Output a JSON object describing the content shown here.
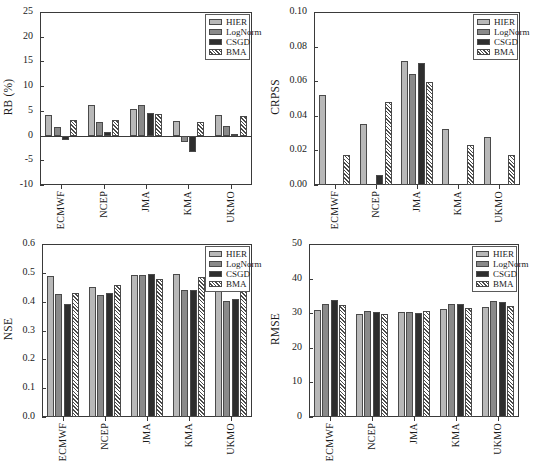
{
  "figure": {
    "panel_order": [
      "rb",
      "crpss",
      "nse",
      "rmse"
    ],
    "categories": [
      "ECMWF",
      "NCEP",
      "JMA",
      "KMA",
      "UKMO"
    ],
    "series_names": [
      "HIER",
      "LogNorm",
      "CSGD",
      "BMA"
    ],
    "colors": {
      "hier": "#b8b8b8",
      "lognorm": "#8a8a8a",
      "csgd": "#2e2e2e",
      "bma": "#ffffff",
      "axis": "#3a3a3a",
      "bar_edge": "#4a4a4a",
      "background": "#ffffff"
    }
  },
  "legend": {
    "entries": [
      {
        "label": "HIER",
        "style": "hier"
      },
      {
        "label": "LogNorm",
        "style": "lognorm"
      },
      {
        "label": "CSGD",
        "style": "csgd"
      },
      {
        "label": "BMA",
        "style": "bma"
      }
    ]
  },
  "chart_data": [
    {
      "id": "rb",
      "type": "bar",
      "title": "",
      "xlabel": "",
      "ylabel": "RB (%)",
      "categories": [
        "ECMWF",
        "NCEP",
        "JMA",
        "KMA",
        "UKMO"
      ],
      "ylim": [
        -10,
        25
      ],
      "yticks": [
        -10,
        -5,
        0,
        5,
        10,
        15,
        20,
        25
      ],
      "ytick_labels": [
        "-10",
        "-5",
        "0",
        "5",
        "10",
        "15",
        "20",
        "25"
      ],
      "grid": false,
      "legend_position": "top-right",
      "zero_line": 0,
      "series": [
        {
          "name": "HIER",
          "values": [
            4.2,
            6.2,
            5.3,
            2.9,
            4.2
          ]
        },
        {
          "name": "LogNorm",
          "values": [
            1.8,
            2.8,
            6.2,
            -1.4,
            2.0
          ]
        },
        {
          "name": "CSGD",
          "values": [
            -0.8,
            0.7,
            4.5,
            -3.3,
            0.3
          ]
        },
        {
          "name": "BMA",
          "values": [
            3.1,
            3.2,
            4.4,
            2.7,
            3.9
          ]
        }
      ]
    },
    {
      "id": "crpss",
      "type": "bar",
      "title": "",
      "xlabel": "",
      "ylabel": "CRPSS",
      "categories": [
        "ECMWF",
        "NCEP",
        "JMA",
        "KMA",
        "UKMO"
      ],
      "ylim": [
        0.0,
        0.1
      ],
      "yticks": [
        0.0,
        0.02,
        0.04,
        0.06,
        0.08,
        0.1
      ],
      "ytick_labels": [
        "0.00",
        "0.02",
        "0.04",
        "0.06",
        "0.08",
        "0.10"
      ],
      "grid": false,
      "legend_position": "top-right",
      "series": [
        {
          "name": "HIER",
          "values": [
            0.052,
            0.0355,
            0.0718,
            0.0322,
            0.0278
          ]
        },
        {
          "name": "LogNorm",
          "values": [
            0.0,
            0.0,
            0.0639,
            0.0,
            0.0
          ]
        },
        {
          "name": "CSGD",
          "values": [
            0.0,
            0.0055,
            0.0708,
            0.0,
            0.0
          ]
        },
        {
          "name": "BMA",
          "values": [
            0.0172,
            0.0482,
            0.0597,
            0.0232,
            0.0172
          ]
        }
      ]
    },
    {
      "id": "nse",
      "type": "bar",
      "title": "",
      "xlabel": "",
      "ylabel": "NSE",
      "categories": [
        "ECMWF",
        "NCEP",
        "JMA",
        "KMA",
        "UKMO"
      ],
      "ylim": [
        0.0,
        0.6
      ],
      "yticks": [
        0.0,
        0.1,
        0.2,
        0.3,
        0.4,
        0.5,
        0.6
      ],
      "ytick_labels": [
        "0.0",
        "0.1",
        "0.2",
        "0.3",
        "0.4",
        "0.5",
        "0.6"
      ],
      "grid": false,
      "legend_position": "top-right",
      "series": [
        {
          "name": "HIER",
          "values": [
            0.49,
            0.452,
            0.491,
            0.497,
            0.471
          ]
        },
        {
          "name": "LogNorm",
          "values": [
            0.428,
            0.423,
            0.491,
            0.441,
            0.404
          ]
        },
        {
          "name": "CSGD",
          "values": [
            0.392,
            0.431,
            0.497,
            0.441,
            0.408
          ]
        },
        {
          "name": "BMA",
          "values": [
            0.431,
            0.459,
            0.479,
            0.486,
            0.447
          ]
        }
      ]
    },
    {
      "id": "rmse",
      "type": "bar",
      "title": "",
      "xlabel": "",
      "ylabel": "RMSE",
      "categories": [
        "ECMWF",
        "NCEP",
        "JMA",
        "KMA",
        "UKMO"
      ],
      "ylim": [
        0,
        50
      ],
      "yticks": [
        0,
        10,
        20,
        30,
        40,
        50
      ],
      "ytick_labels": [
        "0",
        "10",
        "20",
        "30",
        "40",
        "50"
      ],
      "grid": false,
      "legend_position": "top-right",
      "series": [
        {
          "name": "HIER",
          "values": [
            30.9,
            29.8,
            30.3,
            31.2,
            31.7
          ]
        },
        {
          "name": "LogNorm",
          "values": [
            32.6,
            30.7,
            30.3,
            32.8,
            33.5
          ]
        },
        {
          "name": "CSGD",
          "values": [
            33.9,
            30.4,
            30.2,
            32.8,
            33.1
          ]
        },
        {
          "name": "BMA",
          "values": [
            32.5,
            29.9,
            30.5,
            31.6,
            32.2
          ]
        }
      ]
    }
  ]
}
